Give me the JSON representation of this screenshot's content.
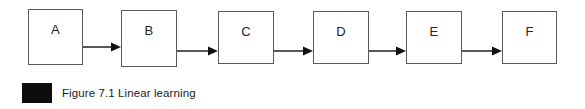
{
  "figure": {
    "caption": {
      "marker": "black-square-marker",
      "text": "Figure 7.1 Linear learning"
    },
    "diagram": {
      "type": "linear-flow",
      "direction": "left-to-right",
      "node_count": 6,
      "nodes": [
        {
          "label": "A",
          "x": 28,
          "y": 9,
          "width": 55,
          "height": 56
        },
        {
          "label": "B",
          "x": 121,
          "y": 10,
          "width": 56,
          "height": 57
        },
        {
          "label": "C",
          "x": 218,
          "y": 11,
          "width": 56,
          "height": 53
        },
        {
          "label": "D",
          "x": 313,
          "y": 11,
          "width": 56,
          "height": 53
        },
        {
          "label": "E",
          "x": 406,
          "y": 11,
          "width": 56,
          "height": 53
        },
        {
          "label": "F",
          "x": 502,
          "y": 11,
          "width": 55,
          "height": 53
        }
      ],
      "arrows": [
        {
          "from": "A",
          "to": "B",
          "x": 83,
          "y": 41,
          "length": 38
        },
        {
          "from": "B",
          "to": "C",
          "x": 177,
          "y": 45,
          "length": 41
        },
        {
          "from": "C",
          "to": "D",
          "x": 274,
          "y": 45,
          "length": 39
        },
        {
          "from": "D",
          "to": "E",
          "x": 369,
          "y": 45,
          "length": 37
        },
        {
          "from": "E",
          "to": "F",
          "x": 462,
          "y": 45,
          "length": 40
        }
      ],
      "colors": {
        "node_border": "#5a5a5a",
        "node_fill": "#ffffff",
        "arrow": "#111111",
        "label_text": "#262626",
        "background": "#ffffff",
        "caption_marker": "#0d0d0d"
      }
    }
  }
}
